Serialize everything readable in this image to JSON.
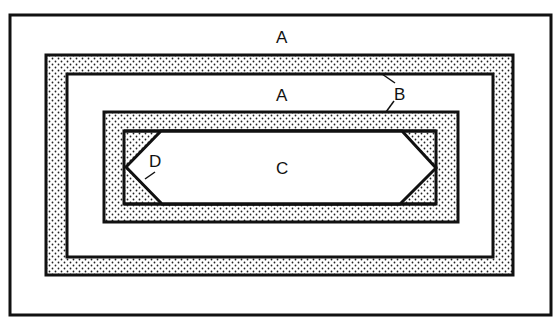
{
  "diagram": {
    "labels": {
      "outer_region": "A",
      "middle_region": "A",
      "band": "B",
      "center": "C",
      "corner": "D"
    },
    "colors": {
      "line": "#111111",
      "background": "#ffffff",
      "stipple_dot": "#222222"
    }
  }
}
